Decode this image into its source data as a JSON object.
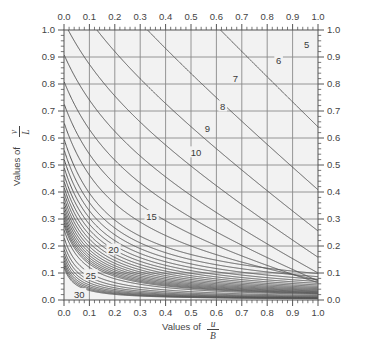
{
  "chart_data": {
    "type": "line",
    "title": "",
    "xlabel_prefix": "Values of",
    "xlabel_numerator": "u",
    "xlabel_denominator": "B",
    "ylabel_prefix": "Values of",
    "ylabel_numerator": "v",
    "ylabel_denominator": "L",
    "xlim": [
      0.0,
      1.0
    ],
    "ylim": [
      0.0,
      1.0
    ],
    "xticks": [
      "0.0",
      "0.1",
      "0.2",
      "0.3",
      "0.4",
      "0.5",
      "0.6",
      "0.7",
      "0.8",
      "0.9",
      "1.0"
    ],
    "yticks": [
      "0.0",
      "0.1",
      "0.2",
      "0.3",
      "0.4",
      "0.5",
      "0.6",
      "0.7",
      "0.8",
      "0.9",
      "1.0"
    ],
    "xtick_values": [
      0.0,
      0.1,
      0.2,
      0.3,
      0.4,
      0.5,
      0.6,
      0.7,
      0.8,
      0.9,
      1.0
    ],
    "ytick_values": [
      0.0,
      0.1,
      0.2,
      0.3,
      0.4,
      0.5,
      0.6,
      0.7,
      0.8,
      0.9,
      1.0
    ],
    "minor_tick_step": 0.02,
    "grid": true,
    "grid_color": "#8a8a8a",
    "plot_bg": "#f2f2f2",
    "contour_color": "#555555",
    "axes_top": true,
    "axes_right": true,
    "contour_levels": [
      5,
      6,
      7,
      8,
      9,
      10,
      15,
      20,
      25,
      30
    ],
    "labeled_levels": [
      {
        "value": "5",
        "x": 0.955,
        "y": 0.945
      },
      {
        "value": "6",
        "x": 0.845,
        "y": 0.885
      },
      {
        "value": "7",
        "x": 0.675,
        "y": 0.82
      },
      {
        "value": "8",
        "x": 0.625,
        "y": 0.715
      },
      {
        "value": "9",
        "x": 0.565,
        "y": 0.635
      },
      {
        "value": "10",
        "x": 0.52,
        "y": 0.545
      },
      {
        "value": "15",
        "x": 0.345,
        "y": 0.31
      },
      {
        "value": "20",
        "x": 0.195,
        "y": 0.185
      },
      {
        "value": "25",
        "x": 0.105,
        "y": 0.09
      },
      {
        "value": "30",
        "x": 0.06,
        "y": 0.02
      }
    ],
    "unlabeled_level_count": 22
  },
  "figure": {
    "axis_label_x": "Values of",
    "axis_label_y": "Values of"
  }
}
